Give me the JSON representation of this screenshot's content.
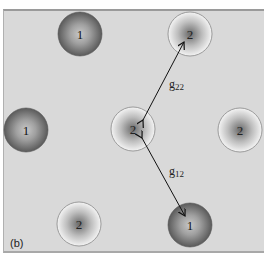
{
  "figure": {
    "panel_label": "(b)",
    "background_color": "#d9d9d9",
    "particles": [
      {
        "id": "p1",
        "type": "1",
        "label": "1",
        "cx": 80,
        "cy": 34,
        "r": 22
      },
      {
        "id": "p2",
        "type": "2",
        "label": "2",
        "cx": 190,
        "cy": 34,
        "r": 22
      },
      {
        "id": "p3",
        "type": "1",
        "label": "1",
        "cx": 26,
        "cy": 130,
        "r": 22
      },
      {
        "id": "p4",
        "type": "2",
        "label": "2",
        "cx": 133,
        "cy": 129,
        "r": 22
      },
      {
        "id": "p5",
        "type": "2",
        "label": "2",
        "cx": 240,
        "cy": 130,
        "r": 22
      },
      {
        "id": "p6",
        "type": "2",
        "label": "2",
        "cx": 79,
        "cy": 224,
        "r": 22
      },
      {
        "id": "p7",
        "type": "1",
        "label": "1",
        "cx": 190,
        "cy": 225,
        "r": 22
      }
    ],
    "arrows": [
      {
        "id": "g22",
        "label": "g",
        "subscript": "22",
        "from": "p4",
        "to": "p2"
      },
      {
        "id": "g12",
        "label": "g",
        "subscript": "12",
        "from": "p4",
        "to": "p7"
      }
    ]
  }
}
